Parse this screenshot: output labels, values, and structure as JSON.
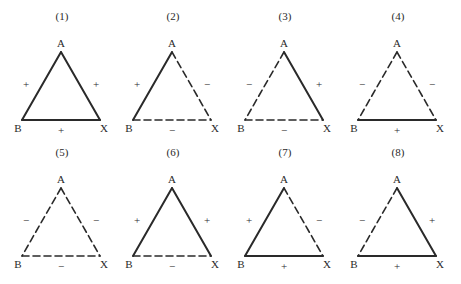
{
  "diagram": {
    "type": "signed-triad-balance",
    "vertex_labels": {
      "top": "A",
      "left": "B",
      "right": "X"
    },
    "legend": {
      "solid": "positive (+) relation",
      "dashed": "negative (−) relation"
    },
    "colors": {
      "stroke": "#2a2a2a",
      "background": "#ffffff"
    },
    "triangles": [
      {
        "id": "1",
        "label": "(1)",
        "AB": "+",
        "AX": "+",
        "BX": "+"
      },
      {
        "id": "2",
        "label": "(2)",
        "AB": "+",
        "AX": "−",
        "BX": "−"
      },
      {
        "id": "3",
        "label": "(3)",
        "AB": "−",
        "AX": "+",
        "BX": "−"
      },
      {
        "id": "4",
        "label": "(4)",
        "AB": "−",
        "AX": "−",
        "BX": "+"
      },
      {
        "id": "5",
        "label": "(5)",
        "AB": "−",
        "AX": "−",
        "BX": "−"
      },
      {
        "id": "6",
        "label": "(6)",
        "AB": "+",
        "AX": "+",
        "BX": "−"
      },
      {
        "id": "7",
        "label": "(7)",
        "AB": "+",
        "AX": "−",
        "BX": "+"
      },
      {
        "id": "8",
        "label": "(8)",
        "AB": "−",
        "AX": "+",
        "BX": "+"
      }
    ]
  }
}
